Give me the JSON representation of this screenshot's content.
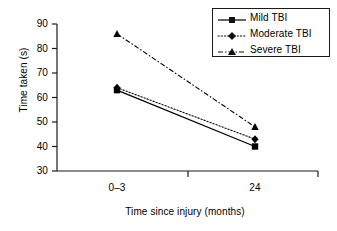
{
  "chart_data": {
    "type": "line",
    "title": "",
    "xlabel": "Time since injury (months)",
    "ylabel": "Time taken (s)",
    "categories": [
      "0–3",
      "24"
    ],
    "ylim": [
      30,
      90
    ],
    "yticks": [
      30,
      40,
      50,
      60,
      70,
      80,
      90
    ],
    "ytick_labels": [
      "30",
      "40",
      "50",
      "60",
      "70",
      "80",
      "90"
    ],
    "grid": false,
    "legend_position": "top-right",
    "series": [
      {
        "name": "Mild TBI",
        "values": [
          63,
          40
        ],
        "line_style": "solid",
        "marker": "square",
        "color": "#000000"
      },
      {
        "name": "Moderate TBI",
        "values": [
          64,
          43
        ],
        "line_style": "dotted",
        "marker": "diamond",
        "color": "#000000"
      },
      {
        "name": "Severe TBI",
        "values": [
          86,
          48
        ],
        "line_style": "dash-dot",
        "marker": "triangle",
        "color": "#000000"
      }
    ]
  },
  "axes": {
    "y_title": "Time taken (s)",
    "x_title": "Time since injury (months)",
    "y_ticks": [
      {
        "label": "90",
        "value": 90
      },
      {
        "label": "80",
        "value": 80
      },
      {
        "label": "70",
        "value": 70
      },
      {
        "label": "60",
        "value": 60
      },
      {
        "label": "50",
        "value": 50
      },
      {
        "label": "40",
        "value": 40
      },
      {
        "label": "30",
        "value": 30
      }
    ],
    "x_ticks": [
      {
        "label": "0–3"
      },
      {
        "label": "24"
      }
    ]
  },
  "legend": {
    "entries": [
      {
        "label": "Mild TBI"
      },
      {
        "label": "Moderate TBI"
      },
      {
        "label": "Severe TBI"
      }
    ]
  }
}
